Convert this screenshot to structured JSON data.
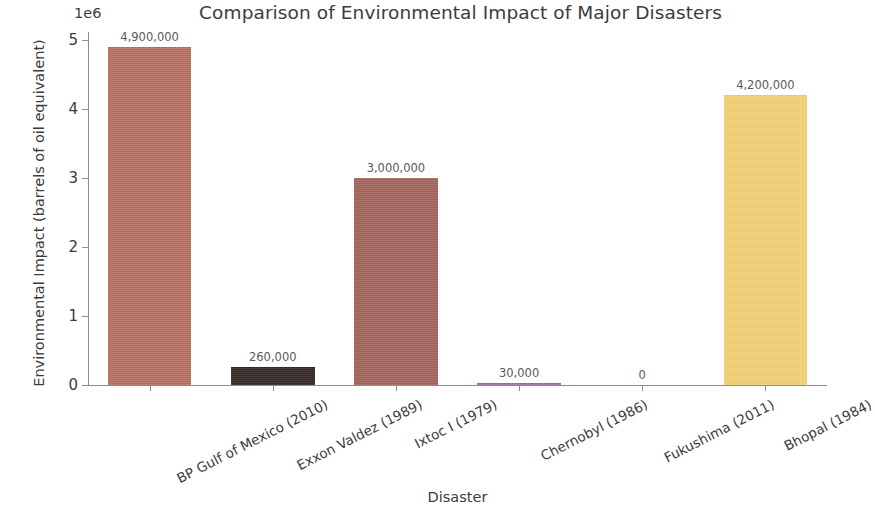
{
  "chart_data": {
    "type": "bar",
    "title": "Comparison of Environmental Impact of Major Disasters",
    "xlabel": "Disaster",
    "ylabel": "Environmental Impact (barrels of oil equivalent)",
    "y_offset_text": "1e6",
    "categories": [
      "BP Gulf of Mexico (2010)",
      "Exxon Valdez (1989)",
      "Ixtoc I (1979)",
      "Chernobyl (1986)",
      "Fukushima (2011)",
      "Bhopal (1984)"
    ],
    "values": [
      4900000,
      260000,
      3000000,
      30000,
      0,
      4200000
    ],
    "value_labels": [
      "4,900,000",
      "260,000",
      "3,000,000",
      "30,000",
      "0",
      "4,200,000"
    ],
    "bar_colors": [
      "#b5705f",
      "#332523",
      "#a1635a",
      "#9b6fa8",
      "#c8c8c8",
      "#f5d271"
    ],
    "ylim": [
      0,
      5200000
    ],
    "yticks": [
      0,
      1000000,
      2000000,
      3000000,
      4000000,
      5000000
    ],
    "ytick_labels": [
      "0",
      "1",
      "2",
      "3",
      "4",
      "5"
    ],
    "grid": false,
    "legend": false,
    "background_color": "#ffffff",
    "axis_color": "#8d8d8d",
    "text_color": "#3c3c3c"
  }
}
